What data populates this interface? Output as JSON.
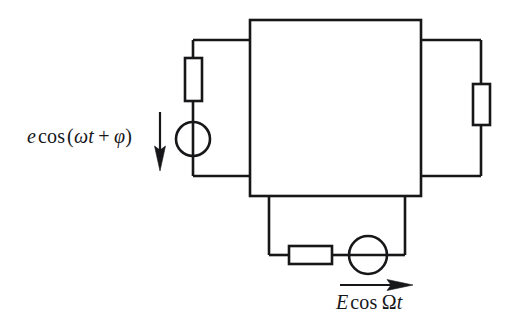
{
  "figure": {
    "type": "circuit-diagram",
    "title": "",
    "background_color": "#ffffff",
    "stroke_color": "#17171a",
    "width": 514,
    "height": 330
  },
  "labels": {
    "left_source": {
      "text": "e cos (ω t + φ)",
      "parts": {
        "amplitude": "e",
        "function": "cos",
        "open_paren": "(",
        "angular_frequency": "ω",
        "time": "t",
        "plus": "+",
        "phase": "φ",
        "close_paren": ")"
      },
      "arrow_direction": "down"
    },
    "bottom_source": {
      "text": "E cos Ω t",
      "parts": {
        "amplitude": "E",
        "function": "cos",
        "angular_frequency": "Ω",
        "time": "t"
      },
      "arrow_direction": "right"
    }
  },
  "components": {
    "main_block": {
      "name": "central-two-port-block",
      "x": 250,
      "y": 20,
      "width": 171,
      "height": 176
    },
    "left_resistor": {
      "name": "left-resistor",
      "orientation": "vertical",
      "x": 185,
      "y": 58,
      "width": 17,
      "height": 43
    },
    "left_source_symbol": {
      "name": "left-voltage-source",
      "shape": "circle",
      "cx": 193,
      "cy": 139,
      "r": 17
    },
    "right_resistor": {
      "name": "right-resistor",
      "orientation": "vertical",
      "x": 473,
      "y": 84,
      "width": 17,
      "height": 41
    },
    "bottom_resistor": {
      "name": "bottom-resistor",
      "orientation": "horizontal",
      "x": 289,
      "y": 246,
      "width": 43,
      "height": 18
    },
    "bottom_source_symbol": {
      "name": "bottom-voltage-source",
      "shape": "circle",
      "cx": 368,
      "cy": 255,
      "r": 19
    }
  },
  "arrows": {
    "left_arrow": {
      "x": 160,
      "y1": 112,
      "y2": 170
    },
    "bottom_arrow": {
      "x1": 340,
      "x2": 412,
      "y": 285
    }
  }
}
